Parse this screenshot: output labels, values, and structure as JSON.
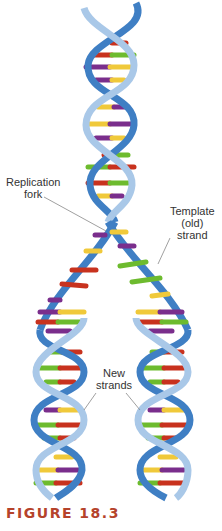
{
  "figure": {
    "caption": "FIGURE 18.3",
    "caption_color": "#b5432b"
  },
  "labels": {
    "replication_fork": [
      "Replication",
      "fork"
    ],
    "template_strand": [
      "Template",
      "(old)",
      "strand"
    ],
    "new_strands": [
      "New",
      "strands"
    ]
  },
  "colors": {
    "backbone": "#3f7fc4",
    "backbone_light": "#a9c8e8",
    "base_red": "#c8321e",
    "base_green": "#6dbb2e",
    "base_yellow": "#f0c93a",
    "base_purple": "#7a2e8c",
    "leader_line": "#888888"
  }
}
